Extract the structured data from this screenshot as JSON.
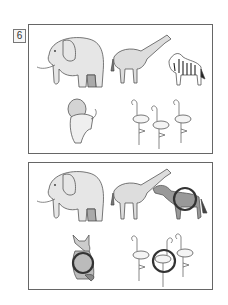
{
  "worksheet": {
    "puzzle_number": "6",
    "type": "spot-the-difference",
    "top_panel": {
      "animals": [
        "elephant",
        "giraffe",
        "zebra",
        "lion",
        "flamingo",
        "flamingo",
        "flamingo"
      ]
    },
    "bottom_panel": {
      "animals": [
        "elephant",
        "giraffe",
        "horse",
        "cat",
        "flamingo",
        "flamingo",
        "flamingo"
      ],
      "difference_circles": [
        {
          "target": "horse-body",
          "note": "zebra replaced by horse"
        },
        {
          "target": "cat-body",
          "note": "lion replaced by cat"
        },
        {
          "target": "middle-flamingo",
          "note": "flamingo turned"
        }
      ]
    },
    "colors": {
      "border": "#666666",
      "lineart": "#555555",
      "fill": "#e6e6e6",
      "circle": "#333333"
    }
  }
}
